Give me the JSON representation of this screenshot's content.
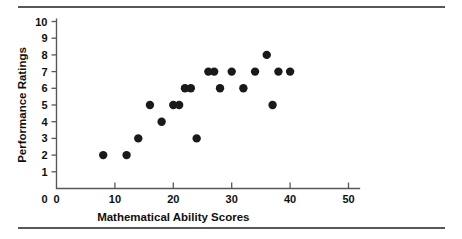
{
  "figure": {
    "has_top_rule": true,
    "has_bottom_rule": true,
    "rule_color": "#58585a"
  },
  "chart_data": {
    "type": "scatter",
    "title": "",
    "xlabel": "Mathematical Ability Scores",
    "ylabel": "Performance Ratings",
    "xlim": [
      0,
      52
    ],
    "ylim": [
      0,
      10.4
    ],
    "xticks": [
      0,
      10,
      20,
      30,
      40,
      50
    ],
    "xtick_labels": [
      "0",
      "10",
      "20",
      "30",
      "40",
      "50"
    ],
    "yticks": [
      1,
      2,
      3,
      4,
      5,
      6,
      7,
      8,
      9,
      10
    ],
    "ytick_labels": [
      "1",
      "2",
      "3",
      "4",
      "5",
      "6",
      "7",
      "8",
      "9",
      "10"
    ],
    "y_zero_label": "0",
    "grid": false,
    "legend": null,
    "marker": {
      "shape": "circle",
      "color": "#1a1a1a",
      "size": 4.2
    },
    "points": [
      {
        "x": 8,
        "y": 2
      },
      {
        "x": 12,
        "y": 2
      },
      {
        "x": 14,
        "y": 3
      },
      {
        "x": 16,
        "y": 5
      },
      {
        "x": 18,
        "y": 4
      },
      {
        "x": 20,
        "y": 5
      },
      {
        "x": 21,
        "y": 5
      },
      {
        "x": 22,
        "y": 6
      },
      {
        "x": 23,
        "y": 6
      },
      {
        "x": 24,
        "y": 3
      },
      {
        "x": 26,
        "y": 7
      },
      {
        "x": 27,
        "y": 7
      },
      {
        "x": 28,
        "y": 6
      },
      {
        "x": 30,
        "y": 7
      },
      {
        "x": 32,
        "y": 6
      },
      {
        "x": 34,
        "y": 7
      },
      {
        "x": 36,
        "y": 8
      },
      {
        "x": 37,
        "y": 5
      },
      {
        "x": 38,
        "y": 7
      },
      {
        "x": 40,
        "y": 7
      }
    ],
    "n_points": 20
  }
}
